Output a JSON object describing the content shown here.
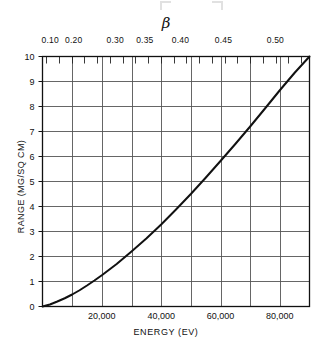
{
  "figure": {
    "top_axis_title": "β",
    "y_axis_title": "RANGE  (MG/SQ CM)",
    "x_axis_title": "ENERGY (EV)"
  },
  "chart_data": {
    "type": "line",
    "title": "",
    "subtitle": "",
    "xlabel": "ENERGY (EV)",
    "ylabel": "RANGE  (MG/SQ CM)",
    "xlim": [
      0,
      90000
    ],
    "ylim": [
      0,
      10
    ],
    "grid": true,
    "legend": null,
    "top_axis": {
      "label": "β",
      "tick_labels": [
        "0.10",
        "0.20",
        "0.30",
        "0.35",
        "0.40",
        "0.45",
        "0.50"
      ],
      "tick_energies_ev": [
        2600,
        10500,
        24500,
        34500,
        46500,
        61000,
        78500
      ],
      "minor_tick_count": 21
    },
    "x_tick_labels": [
      "20,000",
      "40,000",
      "60,000",
      "80,000"
    ],
    "x_tick_values": [
      20000,
      40000,
      60000,
      80000
    ],
    "x_gridline_values": [
      10000,
      20000,
      30000,
      40000,
      50000,
      60000,
      70000,
      80000
    ],
    "y_tick_labels": [
      "0",
      "1",
      "2",
      "3",
      "4",
      "5",
      "6",
      "7",
      "8",
      "9",
      "10"
    ],
    "y_tick_values": [
      0,
      1,
      2,
      3,
      4,
      5,
      6,
      7,
      8,
      9,
      10
    ],
    "series": [
      {
        "name": "range-vs-energy",
        "color": "#111111",
        "x": [
          0,
          2500,
          5000,
          7500,
          10000,
          12500,
          15000,
          17500,
          20000,
          25000,
          30000,
          35000,
          40000,
          45000,
          50000,
          55000,
          60000,
          65000,
          70000,
          75000,
          80000,
          85000,
          90000
        ],
        "y": [
          0.0,
          0.08,
          0.2,
          0.33,
          0.48,
          0.65,
          0.84,
          1.04,
          1.25,
          1.7,
          2.2,
          2.72,
          3.28,
          3.88,
          4.5,
          5.15,
          5.82,
          6.5,
          7.2,
          7.92,
          8.65,
          9.35,
          10.0
        ]
      }
    ]
  },
  "colors": {
    "curve": "#111111",
    "grid": "#555555",
    "axis": "#111111",
    "background": "#ffffff"
  }
}
